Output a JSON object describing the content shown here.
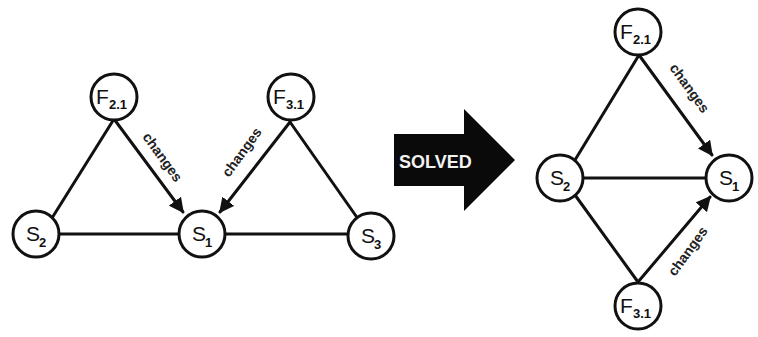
{
  "before": {
    "nodes": {
      "F21": {
        "main": "F",
        "sub": "2.1"
      },
      "F31": {
        "main": "F",
        "sub": "3.1"
      },
      "S2": {
        "main": "S",
        "sub": "2"
      },
      "S1": {
        "main": "S",
        "sub": "1"
      },
      "S3": {
        "main": "S",
        "sub": "3"
      }
    },
    "edge_labels": {
      "f21_s1": "changes",
      "f31_s1": "changes"
    }
  },
  "transition": {
    "label": "SOLVED"
  },
  "after": {
    "nodes": {
      "F21": {
        "main": "F",
        "sub": "2.1"
      },
      "S2": {
        "main": "S",
        "sub": "2"
      },
      "S1": {
        "main": "S",
        "sub": "1"
      },
      "F31": {
        "main": "F",
        "sub": "3.1"
      }
    },
    "edge_labels": {
      "f21_s1": "changes",
      "f31_s1": "changes"
    }
  }
}
